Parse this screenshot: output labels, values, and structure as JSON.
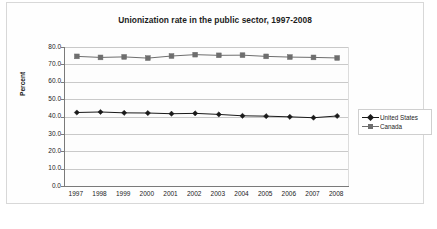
{
  "chart_data": {
    "type": "line",
    "title": "Unionization rate in the public sector, 1997-2008",
    "xlabel": "",
    "ylabel": "Percent",
    "categories": [
      "1997",
      "1998",
      "1999",
      "2000",
      "2001",
      "2002",
      "2003",
      "2004",
      "2005",
      "2006",
      "2007",
      "2008"
    ],
    "ylim": [
      0.0,
      80.0
    ],
    "ytick_labels": [
      "80.0",
      "70.0",
      "60.0",
      "50.0",
      "40.0",
      "30.0",
      "20.0",
      "10.0",
      "0.0"
    ],
    "ytick_values": [
      80.0,
      70.0,
      60.0,
      50.0,
      40.0,
      30.0,
      20.0,
      10.0,
      0.0
    ],
    "grid": true,
    "legend_position": "right",
    "series": [
      {
        "name": "United States",
        "marker": "diamond",
        "color": "#1a1a1a",
        "values": [
          42.3,
          42.6,
          42.1,
          42.0,
          41.6,
          41.8,
          41.2,
          40.4,
          40.2,
          39.8,
          39.3,
          40.3
        ]
      },
      {
        "name": "Canada",
        "marker": "square",
        "color": "#6e6e6e",
        "values": [
          74.6,
          74.0,
          74.3,
          73.6,
          74.8,
          75.6,
          75.2,
          75.3,
          74.6,
          74.2,
          74.0,
          73.7
        ]
      }
    ]
  },
  "legend": {
    "items": [
      {
        "label": "United States"
      },
      {
        "label": "Canada"
      }
    ]
  },
  "colors": {
    "us_series": "#1a1a1a",
    "canada_series": "#6e6e6e",
    "gridline": "#c9c9c9",
    "axis": "#7a7a7a",
    "text": "#1d1d1d"
  }
}
